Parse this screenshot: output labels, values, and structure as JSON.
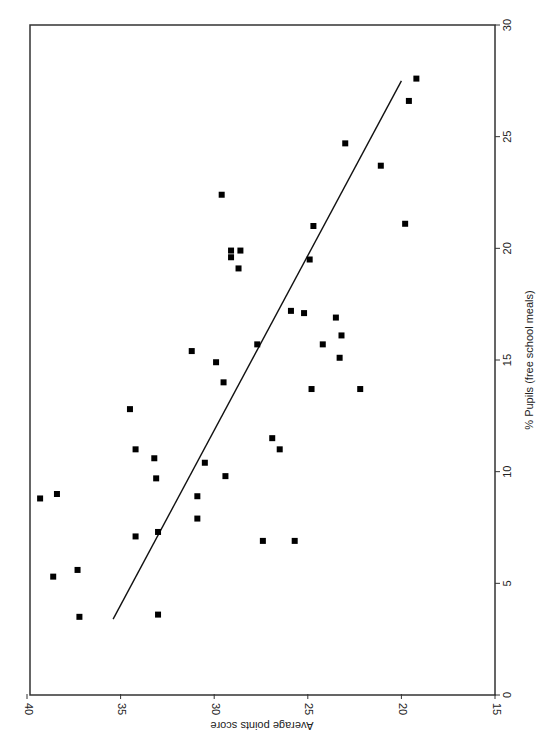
{
  "chart_data": {
    "type": "scatter",
    "orientation": "rotated-90",
    "title": "",
    "xlabel": "Average points score",
    "ylabel": "% Pupils (free school meals)",
    "xlim": [
      40,
      15
    ],
    "ylim": [
      0,
      30
    ],
    "xticks": [
      40,
      35,
      30,
      25,
      20,
      15
    ],
    "yticks": [
      0,
      5,
      10,
      15,
      20,
      25,
      30
    ],
    "grid": false,
    "legend": null,
    "marker": "square",
    "marker_color": "#000000",
    "points": [
      {
        "x": 39.3,
        "y": 8.8
      },
      {
        "x": 38.4,
        "y": 9.0
      },
      {
        "x": 38.6,
        "y": 5.3
      },
      {
        "x": 37.3,
        "y": 5.6
      },
      {
        "x": 37.2,
        "y": 3.5
      },
      {
        "x": 34.5,
        "y": 12.8
      },
      {
        "x": 34.2,
        "y": 11.0
      },
      {
        "x": 34.2,
        "y": 7.1
      },
      {
        "x": 33.2,
        "y": 10.6
      },
      {
        "x": 33.1,
        "y": 9.7
      },
      {
        "x": 33.0,
        "y": 7.3
      },
      {
        "x": 33.0,
        "y": 3.6
      },
      {
        "x": 31.2,
        "y": 15.4
      },
      {
        "x": 30.9,
        "y": 7.9
      },
      {
        "x": 30.9,
        "y": 8.9
      },
      {
        "x": 30.5,
        "y": 10.4
      },
      {
        "x": 29.9,
        "y": 14.9
      },
      {
        "x": 29.6,
        "y": 22.4
      },
      {
        "x": 29.5,
        "y": 14.0
      },
      {
        "x": 29.4,
        "y": 9.8
      },
      {
        "x": 29.1,
        "y": 19.9
      },
      {
        "x": 29.1,
        "y": 19.6
      },
      {
        "x": 28.7,
        "y": 19.1
      },
      {
        "x": 28.6,
        "y": 19.9
      },
      {
        "x": 27.7,
        "y": 15.7
      },
      {
        "x": 27.4,
        "y": 6.9
      },
      {
        "x": 26.9,
        "y": 11.5
      },
      {
        "x": 26.5,
        "y": 11.0
      },
      {
        "x": 25.9,
        "y": 17.2
      },
      {
        "x": 25.7,
        "y": 6.9
      },
      {
        "x": 25.2,
        "y": 17.1
      },
      {
        "x": 24.9,
        "y": 19.5
      },
      {
        "x": 24.8,
        "y": 13.7
      },
      {
        "x": 24.7,
        "y": 21.0
      },
      {
        "x": 24.2,
        "y": 15.7
      },
      {
        "x": 23.5,
        "y": 16.9
      },
      {
        "x": 23.3,
        "y": 15.1
      },
      {
        "x": 23.2,
        "y": 16.1
      },
      {
        "x": 23.0,
        "y": 24.7
      },
      {
        "x": 22.2,
        "y": 13.7
      },
      {
        "x": 21.1,
        "y": 23.7
      },
      {
        "x": 19.8,
        "y": 21.1
      },
      {
        "x": 19.6,
        "y": 26.6
      },
      {
        "x": 19.2,
        "y": 27.6
      }
    ],
    "trendline": {
      "type": "linear",
      "start": {
        "x": 35.4,
        "y": 3.4
      },
      "end": {
        "x": 20.0,
        "y": 27.5
      }
    }
  }
}
